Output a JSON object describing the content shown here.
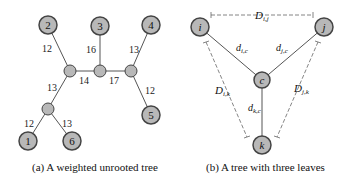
{
  "panel_a": {
    "caption": "(a) A weighted unrooted tree",
    "leaves": [
      {
        "id": "1",
        "label": "1"
      },
      {
        "id": "2",
        "label": "2"
      },
      {
        "id": "3",
        "label": "3"
      },
      {
        "id": "4",
        "label": "4"
      },
      {
        "id": "5",
        "label": "5"
      },
      {
        "id": "6",
        "label": "6"
      }
    ],
    "edge_weights": {
      "e2": "12",
      "e3": "16",
      "e4": "13",
      "e5": "12",
      "e14": "14",
      "e17": "17",
      "e13": "13",
      "e1": "12",
      "e6": "13"
    }
  },
  "panel_b": {
    "caption": "(b) A tree with three leaves",
    "nodes": {
      "i": "i",
      "j": "j",
      "k": "k",
      "c": "c"
    },
    "labels": {
      "D_ij": "D",
      "D_ij_sub": "i,j",
      "d_ic": "d",
      "d_ic_sub": "i,c",
      "d_jc": "d",
      "d_jc_sub": "j,c",
      "d_kc": "d",
      "d_kc_sub": "k,c",
      "D_ik": "D",
      "D_ik_sub": "i,k",
      "D_jk": "D",
      "D_jk_sub": "j,k"
    }
  },
  "colors": {
    "node_fill": "#b8b8b8",
    "node_stroke": "#444444",
    "edge": "#555555",
    "dashed": "#666666"
  }
}
